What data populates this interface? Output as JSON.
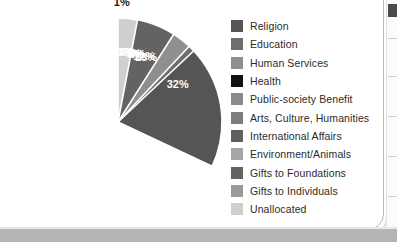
{
  "chart_data": {
    "type": "pie",
    "title": "",
    "legend_position": "right",
    "labels": [
      "Religion",
      "Education",
      "Human Services",
      "Health",
      "Public-society Benefit",
      "Arts, Culture, Humanities",
      "International Affairs",
      "Environment/Animals",
      "Gifts to Foundations",
      "Gifts to Individuals",
      "Unallocated"
    ],
    "values": [
      32,
      13,
      12,
      8,
      7,
      4,
      8,
      3,
      9,
      1,
      3
    ],
    "value_labels": [
      "32%",
      "13%",
      "12%",
      "8%",
      "7%",
      "4%",
      "8%",
      "3%",
      "9%",
      "1%",
      "3%"
    ],
    "colors": [
      "#555555",
      "#6e6e6e",
      "#8f8f8f",
      "#121212",
      "#8a8a8a",
      "#7d7d7d",
      "#5f5f5f",
      "#a6a6a6",
      "#636363",
      "#9a9a9a",
      "#cfcfcf"
    ],
    "label_text_colors": [
      "white",
      "white",
      "white",
      "white",
      "white",
      "white",
      "white",
      "white",
      "white",
      "black",
      "white"
    ],
    "start_angle_deg": 0,
    "direction": "clockwise",
    "slice_separator_color": "#ffffff"
  },
  "legend": {
    "items": [
      {
        "label": "Religion",
        "color": "#555555"
      },
      {
        "label": "Education",
        "color": "#6e6e6e"
      },
      {
        "label": "Human Services",
        "color": "#8f8f8f"
      },
      {
        "label": "Health",
        "color": "#121212"
      },
      {
        "label": "Public-society Benefit",
        "color": "#8a8a8a"
      },
      {
        "label": "Arts, Culture, Humanities",
        "color": "#7d7d7d"
      },
      {
        "label": "International Affairs",
        "color": "#5f5f5f"
      },
      {
        "label": "Environment/Animals",
        "color": "#a6a6a6"
      },
      {
        "label": "Gifts to Foundations",
        "color": "#636363"
      },
      {
        "label": "Gifts to Individuals",
        "color": "#9a9a9a"
      },
      {
        "label": "Unallocated",
        "color": "#cfcfcf"
      }
    ]
  }
}
